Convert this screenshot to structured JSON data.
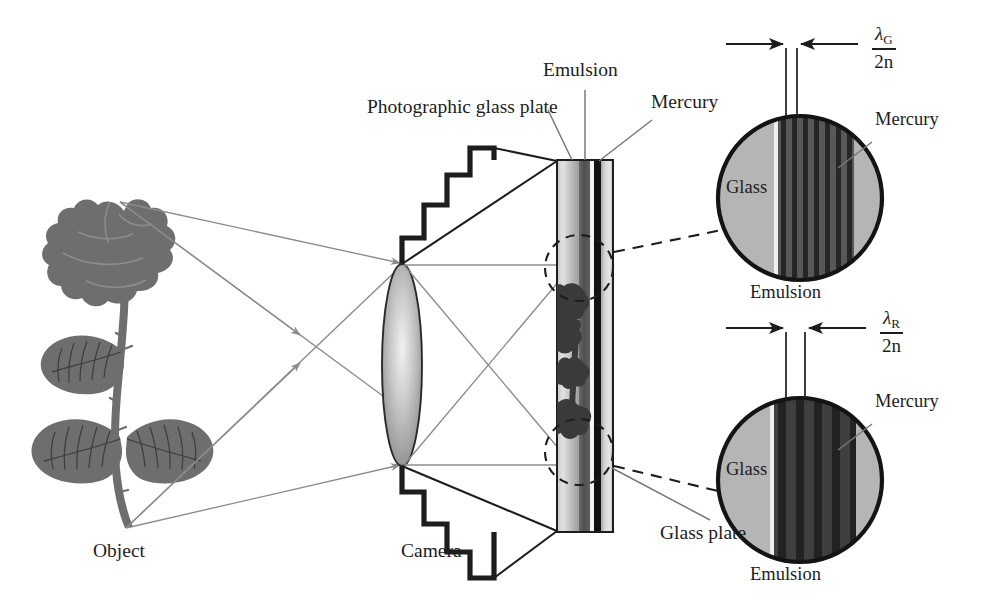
{
  "figure": {
    "type": "optical-schematic"
  },
  "labels": {
    "object": "Object",
    "camera": "Camera",
    "photographic_glass_plate": "Photographic glass plate",
    "emulsion_top": "Emulsion",
    "mercury_plate": "Mercury",
    "glass_plate": "Glass plate",
    "mercury_top_circle": "Mercury",
    "mercury_bottom_circle": "Mercury",
    "glass_top_circle": "Glass",
    "glass_bottom_circle": "Glass",
    "emulsion_top_circle": "Emulsion",
    "emulsion_bottom_circle": "Emulsion"
  },
  "annotations": {
    "top": {
      "numerator": "λ",
      "numerator_subscript": "G",
      "denominator": "2n",
      "meaning": "half wavelength of green light in the emulsion"
    },
    "bottom": {
      "numerator": "λ",
      "numerator_subscript": "R",
      "denominator": "2n",
      "meaning": "half wavelength of red light in the emulsion"
    }
  },
  "detail_circles": [
    {
      "id": "green-detail",
      "wavelength_label": "lambda_G",
      "fringe_count": 8,
      "fringe_spacing_px": 11,
      "note": "narrow fringe spacing for green"
    },
    {
      "id": "red-detail",
      "wavelength_label": "lambda_R",
      "fringe_count": 5,
      "fringe_spacing_px": 18,
      "note": "wider fringe spacing for red"
    }
  ],
  "colors": {
    "ink": "#1d1d1d",
    "ray": "#8c8c8c",
    "glass_light": "#b4b4b4",
    "glass_mid": "#d0d0d0",
    "emulsion_dark": "#4a4a4a",
    "fringe_dark": "#2b2b2b",
    "mercury_black": "#111111",
    "object_gray": "#6e6e6e",
    "lens_gray": "#9a9a9a",
    "background": "#ffffff"
  }
}
